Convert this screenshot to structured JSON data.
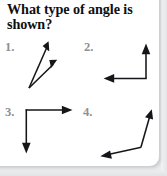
{
  "worksheet": {
    "title_line_1": "What type of angle is",
    "title_line_2": "shown?",
    "items": [
      {
        "label": "1.",
        "angle_type": "acute",
        "vertex": [
          29,
          88
        ],
        "rays": [
          {
            "name": "ray-up-steep",
            "to": [
              48,
              42
            ]
          },
          {
            "name": "ray-up-shallow",
            "to": [
              56,
              60
            ]
          }
        ]
      },
      {
        "label": "2.",
        "angle_type": "right",
        "vertex": [
          146,
          78
        ],
        "rays": [
          {
            "name": "ray-up",
            "to": [
              146,
              44
            ]
          },
          {
            "name": "ray-left",
            "to": [
              104,
              78
            ]
          }
        ]
      },
      {
        "label": "3.",
        "angle_type": "right",
        "vertex": [
          26,
          110
        ],
        "rays": [
          {
            "name": "ray-right",
            "to": [
              72,
              110
            ]
          },
          {
            "name": "ray-down",
            "to": [
              26,
              153
            ]
          }
        ]
      },
      {
        "label": "4.",
        "angle_type": "obtuse",
        "vertex": [
          141,
          147
        ],
        "rays": [
          {
            "name": "ray-up-right",
            "to": [
              152,
              109
            ]
          },
          {
            "name": "ray-down-left",
            "to": [
              100,
              157
            ]
          }
        ]
      }
    ]
  },
  "colors": {
    "ink": "#16161a",
    "label_gray": "#8e9095",
    "card_background": "#ffffff",
    "page_background": "#e9eaec"
  }
}
